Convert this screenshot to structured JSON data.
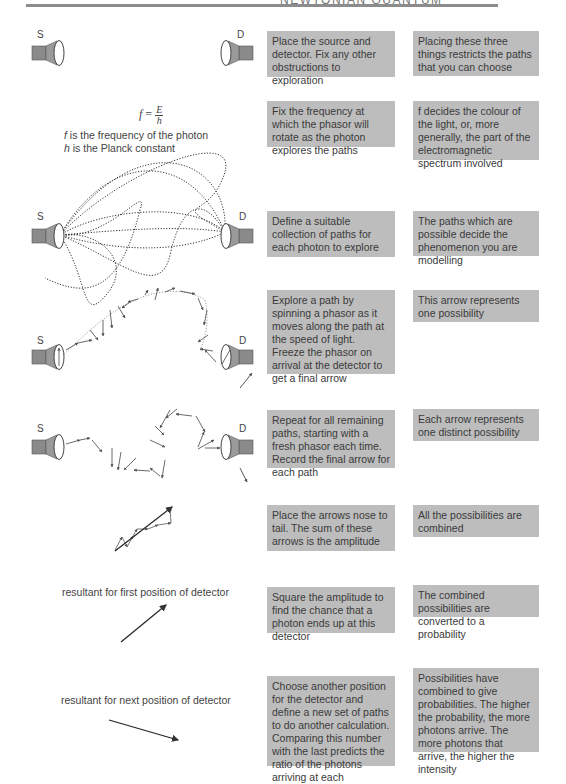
{
  "header": {
    "running_title": "NEWTONIAN QUANTUM"
  },
  "labels": {
    "source": "S",
    "detector": "D"
  },
  "formula": {
    "lhs": "f",
    "equals": "=",
    "numerator": "E",
    "denominator": "h",
    "note_f_symbol": "f",
    "note_f_text": " is the frequency of the photon",
    "note_h_symbol": "h",
    "note_h_text": " is the Planck constant"
  },
  "captions": {
    "first_resultant": "resultant for first position of detector",
    "next_resultant": "resultant for next position of detector"
  },
  "steps": [
    {
      "action": "Place the source and detector. Fix any other obstructions to exploration",
      "meaning": "Placing these three things restricts the paths that you can choose"
    },
    {
      "action": "Fix the frequency at which the phasor will rotate as the photon explores the paths",
      "meaning": "f decides the colour of the light, or, more generally, the part of the electromagnetic spectrum involved"
    },
    {
      "action": "Define a suitable collection of paths for each photon to explore",
      "meaning": "The paths which are possible decide the phenomenon you are modelling"
    },
    {
      "action": "Explore a path by spinning a phasor as it moves along the path at the speed of light. Freeze the phasor on arrival at the detector to get a final arrow",
      "meaning": "This arrow represents one possibility"
    },
    {
      "action": "Repeat for all remaining paths, starting with a fresh phasor each time. Record the final arrow for each path",
      "meaning": "Each arrow represents one distinct possibility"
    },
    {
      "action": "Place the arrows nose to tail. The sum of these arrows is the amplitude",
      "meaning": "All the possibilities are combined"
    },
    {
      "action": "Square the amplitude to find the chance that a photon ends up at this detector",
      "meaning": "The combined possibilities are converted to a probability"
    },
    {
      "action": "Choose another position for the detector and define a new set of paths to do another calculation. Comparing this number with the last predicts the ratio of the photons arriving at each",
      "meaning": "Possibilities have combined to give probabilities. The higher the probability, the more photons arrive. The more photons that arrive, the higher the intensity"
    }
  ],
  "colors": {
    "box_fill": "#bdbdbd",
    "rule": "#8c8c8c",
    "device_fill": "#8a8a8a"
  }
}
